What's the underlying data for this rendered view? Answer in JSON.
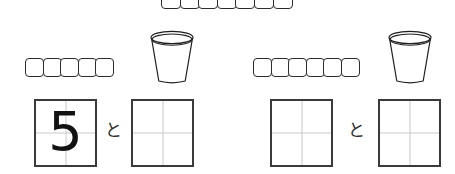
{
  "page": {
    "kind": "math-worksheet",
    "language": "ja",
    "background_color": "#ffffff",
    "ink_color": "#2b2b2b",
    "guide_color": "#c9c9c9"
  },
  "top_strip": {
    "label": "cube-strip",
    "cube_count": 7,
    "cube_symbol": "",
    "clipped_top": true
  },
  "problems": [
    {
      "id": "problem-left",
      "cube_strip": {
        "label": "cube-strip",
        "cube_count": 5,
        "cube_symbol": ""
      },
      "bucket": {
        "label": "bucket",
        "shape": "truncated-cone"
      },
      "answer_boxes": [
        {
          "id": "answer-box-a",
          "value": "5",
          "filled": true
        },
        {
          "id": "answer-box-b",
          "value": "",
          "filled": false
        }
      ],
      "connector": "と"
    },
    {
      "id": "problem-right",
      "cube_strip": {
        "label": "cube-strip",
        "cube_count": 6,
        "cube_symbol": ""
      },
      "bucket": {
        "label": "bucket",
        "shape": "truncated-cone"
      },
      "answer_boxes": [
        {
          "id": "answer-box-c",
          "value": "",
          "filled": false
        },
        {
          "id": "answer-box-d",
          "value": "",
          "filled": false
        }
      ],
      "connector": "と"
    }
  ]
}
